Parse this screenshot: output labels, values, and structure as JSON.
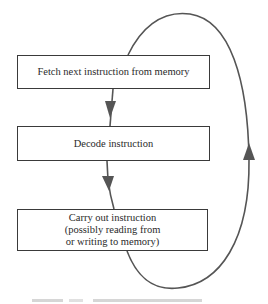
{
  "diagram": {
    "type": "flowchart-cycle",
    "steps": [
      {
        "id": "fetch",
        "lines": [
          "Fetch next instruction from memory"
        ]
      },
      {
        "id": "decode",
        "lines": [
          "Decode instruction"
        ]
      },
      {
        "id": "execute",
        "lines": [
          "Carry out instruction",
          "(possibly reading from",
          "or writing to memory)"
        ]
      }
    ],
    "edges": [
      {
        "from": "fetch",
        "to": "decode",
        "style": "arrow-down"
      },
      {
        "from": "decode",
        "to": "execute",
        "style": "arrow-down"
      },
      {
        "from": "execute",
        "to": "fetch",
        "style": "loop-arrow-up-right-side"
      }
    ],
    "colors": {
      "box_border": "#3a3a3a",
      "arrow": "#555555",
      "text": "#2a2a2a",
      "background": "#ffffff"
    }
  },
  "caption": {
    "text": "",
    "visible": "partially cropped at bottom edge"
  }
}
